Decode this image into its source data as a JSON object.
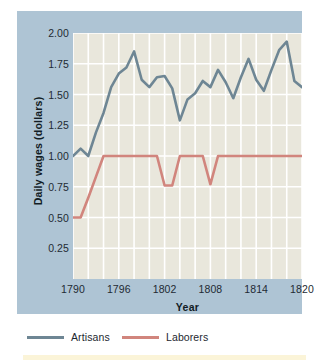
{
  "chart_data": {
    "type": "line",
    "title": "",
    "xlabel": "Year",
    "ylabel": "Daily wages (dollars)",
    "xlim": [
      1790,
      1820
    ],
    "ylim": [
      0.0,
      2.0
    ],
    "grid": true,
    "legend_position": "bottom-left",
    "xticks": [
      1790,
      1796,
      1802,
      1808,
      1814,
      1820
    ],
    "xtick_labels": [
      "1790",
      "1796",
      "1802",
      "1808",
      "1814",
      "1820"
    ],
    "yticks": [
      0.25,
      0.5,
      0.75,
      1.0,
      1.25,
      1.5,
      1.75,
      2.0
    ],
    "ytick_labels": [
      "0.25",
      "0.50",
      "0.75",
      "1.00",
      "1.25",
      "1.50",
      "1.75",
      "2.00"
    ],
    "x": [
      1790,
      1791,
      1792,
      1793,
      1794,
      1795,
      1796,
      1797,
      1798,
      1799,
      1800,
      1801,
      1802,
      1803,
      1804,
      1805,
      1806,
      1807,
      1808,
      1809,
      1810,
      1811,
      1812,
      1813,
      1814,
      1815,
      1816,
      1817,
      1818,
      1819,
      1820
    ],
    "series": [
      {
        "name": "Artisans",
        "color": "#6e8694",
        "values": [
          1.0,
          1.06,
          1.0,
          1.19,
          1.35,
          1.56,
          1.67,
          1.72,
          1.85,
          1.62,
          1.56,
          1.64,
          1.65,
          1.55,
          1.29,
          1.46,
          1.51,
          1.61,
          1.56,
          1.7,
          1.6,
          1.47,
          1.64,
          1.79,
          1.62,
          1.53,
          1.7,
          1.86,
          1.93,
          1.61,
          1.56
        ]
      },
      {
        "name": "Laborers",
        "color": "#d1857d",
        "values": [
          0.5,
          0.5,
          0.66,
          0.83,
          1.0,
          1.0,
          1.0,
          1.0,
          1.0,
          1.0,
          1.0,
          1.0,
          0.76,
          0.76,
          1.0,
          1.0,
          1.0,
          1.0,
          0.77,
          1.0,
          1.0,
          1.0,
          1.0,
          1.0,
          1.0,
          1.0,
          1.0,
          1.0,
          1.0,
          1.0,
          1.0
        ]
      }
    ],
    "legend": [
      {
        "label": "Artisans",
        "color": "#6e8694"
      },
      {
        "label": "Laborers",
        "color": "#d1857d"
      }
    ],
    "colors": {
      "panel_background": "#aec4d4",
      "plot_background": "#e9e7dc",
      "gridline": "#ffffff",
      "text": "#1e2a33",
      "page_background": "#ffffff",
      "bottom_band": "#fbf4d8"
    }
  }
}
